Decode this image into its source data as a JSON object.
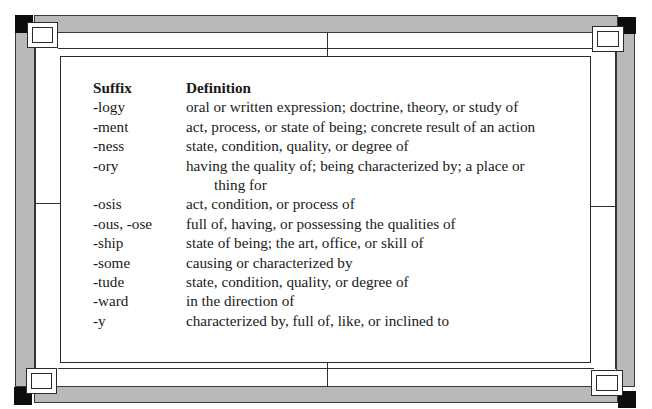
{
  "frame": {
    "colors": {
      "bar": "#b9b9b9",
      "corner": "#0d0d0d",
      "line": "#2f2f2f",
      "background": "#ffffff"
    }
  },
  "table": {
    "headers": {
      "suffix": "Suffix",
      "definition": "Definition"
    },
    "rows": [
      {
        "suffix": "-logy",
        "definition": "oral or written expression; doctrine, theory, or study of"
      },
      {
        "suffix": "-ment",
        "definition": "act, process, or state of being; concrete result of an action"
      },
      {
        "suffix": "-ness",
        "definition": "state, condition, quality, or degree of"
      },
      {
        "suffix": "-ory",
        "definition": "having the quality of; being characterized by; a place or",
        "continuation": "thing for"
      },
      {
        "suffix": "-osis",
        "definition": "act, condition, or process of"
      },
      {
        "suffix": "-ous, -ose",
        "definition": "full of, having, or possessing the qualities of"
      },
      {
        "suffix": "-ship",
        "definition": "state of being; the art, office, or skill of"
      },
      {
        "suffix": "-some",
        "definition": "causing or characterized by"
      },
      {
        "suffix": "-tude",
        "definition": "state, condition, quality, or degree of"
      },
      {
        "suffix": "-ward",
        "definition": "in the direction of"
      },
      {
        "suffix": "-y",
        "definition": "characterized by, full of, like, or inclined to"
      }
    ]
  }
}
